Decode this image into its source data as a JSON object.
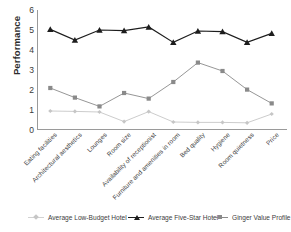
{
  "chart_data": {
    "type": "line",
    "title": "",
    "xlabel": "",
    "ylabel": "Performance",
    "ylim": [
      0,
      6
    ],
    "yticks": [
      0,
      1,
      2,
      3,
      4,
      5,
      6
    ],
    "grid": false,
    "legend_position": "bottom",
    "categories": [
      "Eating facilities",
      "Architectural aesthetics",
      "Lounges",
      "Room size",
      "Availability of receptionist",
      "Furniture and amenities in room",
      "Bed quality",
      "Hygiene",
      "Room quietness",
      "Price"
    ],
    "series": [
      {
        "name": "Average Low-Budget Hotel",
        "color": "#c6c6c6",
        "marker": "diamond",
        "values": [
          0.95,
          0.93,
          0.9,
          0.42,
          0.92,
          0.4,
          0.38,
          0.38,
          0.36,
          0.8
        ]
      },
      {
        "name": "Average Five-Star Hotel",
        "color": "#1d1d1d",
        "marker": "triangle",
        "values": [
          5.03,
          4.5,
          5.0,
          4.97,
          5.15,
          4.38,
          4.95,
          4.92,
          4.38,
          4.83
        ]
      },
      {
        "name": "Ginger Value Profile",
        "color": "#8a8a8a",
        "marker": "square",
        "values": [
          2.1,
          1.62,
          1.18,
          1.85,
          1.57,
          2.4,
          3.37,
          2.95,
          2.02,
          1.33
        ]
      }
    ]
  },
  "colors": {
    "axis": "#9a9a9a",
    "text": "#3d3d3d",
    "title_text": "#2b2b2b",
    "five_star": "#1d1d1d",
    "ginger": "#8a8a8a",
    "low_budget": "#c6c6c6",
    "background": "#ffffff"
  }
}
